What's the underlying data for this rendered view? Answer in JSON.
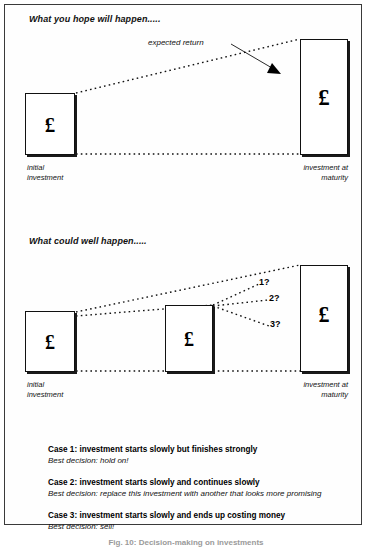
{
  "figure": {
    "caption": "Fig. 10: Decision-making on investments",
    "currency_symbol": "£"
  },
  "panels": [
    {
      "id": "hope",
      "title": "What you hope will happen.....",
      "annotation": "expected return",
      "boxes": [
        {
          "name": "initial-investment",
          "label": "initial\ninvestment",
          "label_line1": "initial",
          "label_line2": "investment",
          "glyph": "£"
        },
        {
          "name": "investment-at-maturity",
          "label_line1": "investment at",
          "label_line2": "maturity",
          "glyph": "£"
        }
      ]
    },
    {
      "id": "reality",
      "title": "What could well happen.....",
      "branches": [
        {
          "name": "branch-1",
          "label": "1?"
        },
        {
          "name": "branch-2",
          "label": "2?"
        },
        {
          "name": "branch-3",
          "label": "3?"
        }
      ],
      "boxes": [
        {
          "name": "initial-investment",
          "label_line1": "initial",
          "label_line2": "investment",
          "glyph": "£"
        },
        {
          "name": "interim-investment",
          "glyph": "£"
        },
        {
          "name": "investment-at-maturity",
          "label_line1": "investment at",
          "label_line2": "maturity",
          "glyph": "£"
        }
      ]
    }
  ],
  "cases": [
    {
      "heading": "Case 1: investment starts slowly but finishes strongly",
      "decision": "Best decision: hold on!"
    },
    {
      "heading": "Case 2: investment starts slowly and continues slowly",
      "decision": "Best decision: replace this investment with another that looks more promising"
    },
    {
      "heading": "Case 3: investment starts slowly and ends up costing money",
      "decision": "Best decision: sell!"
    }
  ]
}
